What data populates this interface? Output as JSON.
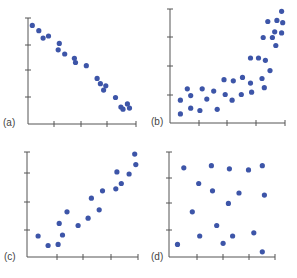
{
  "colors": {
    "dot": "#3d55a8",
    "axis": "#555555"
  },
  "chart_data": [
    {
      "type": "scatter",
      "label": "(a)",
      "title": "",
      "xlabel": "",
      "ylabel": "",
      "xlim": [
        0,
        100
      ],
      "ylim": [
        0,
        100
      ],
      "grid": false,
      "relationship": "strong negative linear",
      "points": [
        [
          4,
          93
        ],
        [
          10,
          88
        ],
        [
          14,
          81
        ],
        [
          19,
          83
        ],
        [
          29,
          76
        ],
        [
          28,
          70
        ],
        [
          34,
          66
        ],
        [
          43,
          62
        ],
        [
          44,
          58
        ],
        [
          54,
          55
        ],
        [
          64,
          43
        ],
        [
          67,
          38
        ],
        [
          72,
          36
        ],
        [
          70,
          32
        ],
        [
          81,
          25
        ],
        [
          86,
          16
        ],
        [
          88,
          14
        ],
        [
          92,
          19
        ],
        [
          94,
          15
        ]
      ]
    },
    {
      "type": "scatter",
      "label": "(b)",
      "title": "",
      "xlabel": "",
      "ylabel": "",
      "xlim": [
        0,
        100
      ],
      "ylim": [
        0,
        100
      ],
      "grid": false,
      "relationship": "positive nonlinear (curved upward)",
      "points": [
        [
          9,
          20
        ],
        [
          9,
          8
        ],
        [
          15,
          30
        ],
        [
          18,
          24
        ],
        [
          18,
          13
        ],
        [
          26,
          11
        ],
        [
          28,
          30
        ],
        [
          32,
          21
        ],
        [
          38,
          28
        ],
        [
          41,
          12
        ],
        [
          47,
          38
        ],
        [
          48,
          25
        ],
        [
          54,
          20
        ],
        [
          55,
          37
        ],
        [
          62,
          25
        ],
        [
          63,
          40
        ],
        [
          70,
          57
        ],
        [
          70,
          35
        ],
        [
          71,
          27
        ],
        [
          77,
          57
        ],
        [
          80,
          39
        ],
        [
          82,
          31
        ],
        [
          83,
          55
        ],
        [
          87,
          46
        ],
        [
          81,
          75
        ],
        [
          85,
          89
        ],
        [
          89,
          75
        ],
        [
          91,
          80
        ],
        [
          92,
          68
        ],
        [
          93,
          90
        ],
        [
          97,
          79
        ],
        [
          97,
          98
        ],
        [
          98,
          88
        ]
      ]
    },
    {
      "type": "scatter",
      "label": "(c)",
      "title": "",
      "xlabel": "",
      "ylabel": "",
      "xlim": [
        0,
        100
      ],
      "ylim": [
        0,
        100
      ],
      "grid": false,
      "relationship": "moderate positive linear",
      "points": [
        [
          10,
          20
        ],
        [
          19,
          11
        ],
        [
          28,
          12
        ],
        [
          29,
          32
        ],
        [
          32,
          21
        ],
        [
          36,
          43
        ],
        [
          46,
          30
        ],
        [
          55,
          37
        ],
        [
          58,
          56
        ],
        [
          65,
          45
        ],
        [
          68,
          63
        ],
        [
          80,
          65
        ],
        [
          81,
          81
        ],
        [
          85,
          70
        ],
        [
          92,
          79
        ],
        [
          98,
          88
        ],
        [
          97,
          98
        ]
      ]
    },
    {
      "type": "scatter",
      "label": "(d)",
      "title": "",
      "xlabel": "",
      "ylabel": "",
      "xlim": [
        0,
        100
      ],
      "ylim": [
        0,
        100
      ],
      "grid": false,
      "relationship": "no association",
      "points": [
        [
          14,
          85
        ],
        [
          40,
          87
        ],
        [
          57,
          84
        ],
        [
          75,
          83
        ],
        [
          88,
          87
        ],
        [
          28,
          70
        ],
        [
          41,
          63
        ],
        [
          66,
          61
        ],
        [
          90,
          59
        ],
        [
          56,
          51
        ],
        [
          22,
          43
        ],
        [
          45,
          30
        ],
        [
          29,
          20
        ],
        [
          60,
          20
        ],
        [
          80,
          23
        ],
        [
          8,
          12
        ],
        [
          51,
          13
        ],
        [
          88,
          5
        ]
      ]
    }
  ],
  "layout": [
    {
      "left": 0,
      "top": 0,
      "ax_x": 28,
      "ax_y": 124,
      "top_y": 18,
      "end_x": 136,
      "yticks": [
        18,
        45,
        70,
        97
      ],
      "xticks": [
        54,
        81,
        107,
        136
      ],
      "label_x": 3,
      "label_y": 118
    },
    {
      "left": 148,
      "top": 0,
      "ax_x": 22,
      "ax_y": 123,
      "top_y": 9,
      "end_x": 137,
      "yticks": [
        9,
        37,
        66,
        95
      ],
      "xticks": [
        51,
        79,
        108,
        137
      ],
      "label_x": 3,
      "label_y": 117
    },
    {
      "left": 0,
      "top": 139,
      "ax_x": 27,
      "ax_y": 118,
      "top_y": 13,
      "end_x": 138,
      "yticks": [
        13,
        34,
        63,
        91
      ],
      "xticks": [
        57,
        83,
        111,
        138
      ],
      "label_x": 4,
      "label_y": 113
    },
    {
      "left": 148,
      "top": 139,
      "ax_x": 21,
      "ax_y": 118,
      "top_y": 13,
      "end_x": 127,
      "yticks": [
        13,
        39,
        64,
        91
      ],
      "xticks": [
        49,
        75,
        101,
        127
      ],
      "label_x": 3,
      "label_y": 113
    }
  ]
}
